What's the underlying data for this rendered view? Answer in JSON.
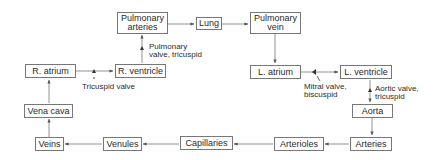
{
  "diagram": {
    "nodes": [
      {
        "id": "pulmonary_arteries",
        "label": "Pulmonary\narteries"
      },
      {
        "id": "lung",
        "label": "Lung"
      },
      {
        "id": "pulmonary_vein",
        "label": "Pulmonary\nvein"
      },
      {
        "id": "r_atrium",
        "label": "R. atrium"
      },
      {
        "id": "r_ventricle",
        "label": "R. ventricle"
      },
      {
        "id": "l_atrium",
        "label": "L. atrium"
      },
      {
        "id": "l_ventricle",
        "label": "L. ventricle"
      },
      {
        "id": "vena_cava",
        "label": "Vena cava"
      },
      {
        "id": "aorta",
        "label": "Aorta"
      },
      {
        "id": "veins",
        "label": "Veins"
      },
      {
        "id": "venules",
        "label": "Venules"
      },
      {
        "id": "capillaries",
        "label": "Capillaries"
      },
      {
        "id": "arterioles",
        "label": "Arterioles"
      },
      {
        "id": "arteries",
        "label": "Arteries"
      }
    ],
    "annotations": {
      "pulmonary_valve": "Pulmonary\nvalve, tricuspid",
      "tricuspid_valve": "Tricuspid valve",
      "mitral_valve": "Mitral valve,\nbiscuspid",
      "aortic_valve": "Aortic valve,\ntricuspid"
    },
    "edges": [
      [
        "r_atrium",
        "r_ventricle"
      ],
      [
        "r_ventricle",
        "pulmonary_arteries"
      ],
      [
        "pulmonary_arteries",
        "lung"
      ],
      [
        "lung",
        "pulmonary_vein"
      ],
      [
        "pulmonary_vein",
        "l_atrium"
      ],
      [
        "l_atrium",
        "l_ventricle"
      ],
      [
        "l_ventricle",
        "aorta"
      ],
      [
        "aorta",
        "arteries"
      ],
      [
        "arteries",
        "arterioles"
      ],
      [
        "arterioles",
        "capillaries"
      ],
      [
        "capillaries",
        "venules"
      ],
      [
        "venules",
        "veins"
      ],
      [
        "veins",
        "vena_cava"
      ],
      [
        "vena_cava",
        "r_atrium"
      ]
    ],
    "colors": {
      "line": "#666666",
      "text": "#2a2a2a",
      "box_border": "#777777"
    }
  }
}
